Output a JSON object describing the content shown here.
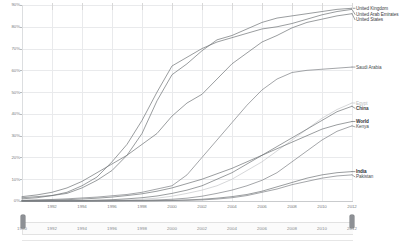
{
  "chart_data": {
    "type": "line",
    "title": "",
    "xlabel": "",
    "ylabel": "",
    "xlim": [
      1990,
      2012
    ],
    "ylim": [
      0,
      90
    ],
    "grid": true,
    "legend_position": "right-of-plot-at-line-end",
    "ytick_labels": [
      "90%",
      "80%",
      "70%",
      "60%",
      "50%",
      "40%",
      "30%",
      "20%",
      "10%",
      "0%"
    ],
    "ytick_values": [
      90,
      80,
      70,
      60,
      50,
      40,
      30,
      20,
      10,
      0
    ],
    "xtick_labels": [
      "1992",
      "1994",
      "1996",
      "1998",
      "2000",
      "2002",
      "2004",
      "2006",
      "2008",
      "2010",
      "2012"
    ],
    "xtick_values": [
      1992,
      1994,
      1996,
      1998,
      2000,
      2002,
      2004,
      2006,
      2008,
      2010,
      2012
    ],
    "x": [
      1990,
      1991,
      1992,
      1993,
      1994,
      1995,
      1996,
      1997,
      1998,
      1999,
      2000,
      2001,
      2002,
      2003,
      2004,
      2005,
      2006,
      2007,
      2008,
      2009,
      2010,
      2011,
      2012
    ],
    "series": [
      {
        "name": "United Kingdom",
        "color": "#6e7276",
        "label_color": "#3a3d40",
        "label_bold": false,
        "values": [
          1.5,
          2.0,
          2.5,
          3.5,
          6.0,
          9.5,
          14.0,
          21.0,
          31.0,
          46.0,
          58.0,
          63.0,
          69.0,
          74.0,
          76.0,
          79.0,
          82.0,
          84.0,
          85.0,
          86.0,
          87.0,
          88.0,
          88.5
        ]
      },
      {
        "name": "United Arab Emirates",
        "color": "#6e7276",
        "label_color": "#3a3d40",
        "label_bold": false,
        "values": [
          1.0,
          1.5,
          2.5,
          4.0,
          7.0,
          11.0,
          18.0,
          26.0,
          37.0,
          50.0,
          62.0,
          66.0,
          70.0,
          73.0,
          75.0,
          77.0,
          79.0,
          80.0,
          81.5,
          83.5,
          85.5,
          87.0,
          88.0
        ]
      },
      {
        "name": "United States",
        "color": "#6e7276",
        "label_color": "#3a3d40",
        "label_bold": false,
        "values": [
          2.0,
          2.8,
          4.0,
          6.0,
          9.0,
          13.0,
          17.0,
          21.0,
          26.0,
          31.0,
          39.0,
          45.0,
          49.0,
          56.0,
          63.0,
          68.0,
          73.0,
          76.0,
          79.5,
          82.0,
          83.5,
          85.0,
          86.0
        ]
      },
      {
        "name": "Saudi Arabia",
        "color": "#7c8084",
        "label_color": "#4a4d50",
        "label_bold": false,
        "values": [
          0.3,
          0.5,
          0.7,
          1.0,
          1.4,
          1.8,
          2.4,
          3.0,
          4.0,
          5.5,
          7.0,
          12.0,
          20.0,
          28.0,
          36.0,
          44.0,
          51.0,
          56.0,
          59.0,
          60.0,
          60.5,
          61.0,
          61.5
        ]
      },
      {
        "name": "Egypt",
        "color": "#c4c6c8",
        "label_color": "#b8babc",
        "label_bold": false,
        "values": [
          0.0,
          0.0,
          0.1,
          0.1,
          0.2,
          0.2,
          0.3,
          0.5,
          0.8,
          1.3,
          2.2,
          3.5,
          5.0,
          7.0,
          10.0,
          14.0,
          18.0,
          23.0,
          28.0,
          33.0,
          38.0,
          42.0,
          45.0
        ]
      },
      {
        "name": "China",
        "color": "#6e7276",
        "label_color": "#3a3d40",
        "label_bold": true,
        "values": [
          0.0,
          0.0,
          0.1,
          0.1,
          0.2,
          0.4,
          0.6,
          1.0,
          1.5,
          2.3,
          3.5,
          5.0,
          7.0,
          10.0,
          13.0,
          17.0,
          21.0,
          25.0,
          29.0,
          33.0,
          37.0,
          41.0,
          43.5
        ]
      },
      {
        "name": "World",
        "color": "#6e7276",
        "label_color": "#26292c",
        "label_bold": true,
        "values": [
          0.2,
          0.3,
          0.4,
          0.6,
          0.9,
          1.3,
          1.8,
          2.5,
          3.3,
          4.5,
          6.0,
          8.0,
          10.0,
          12.5,
          15.0,
          18.0,
          21.0,
          24.0,
          27.0,
          30.0,
          33.0,
          35.0,
          36.5
        ]
      },
      {
        "name": "Kenya",
        "color": "#7c8084",
        "label_color": "#4a4d50",
        "label_bold": false,
        "values": [
          0.0,
          0.0,
          0.0,
          0.0,
          0.0,
          0.1,
          0.1,
          0.2,
          0.3,
          0.5,
          0.8,
          1.3,
          2.2,
          3.5,
          5.0,
          7.0,
          9.5,
          13.0,
          18.0,
          23.0,
          28.0,
          32.0,
          34.5
        ]
      },
      {
        "name": "India",
        "color": "#6e7276",
        "label_color": "#26292c",
        "label_bold": true,
        "values": [
          0.0,
          0.0,
          0.0,
          0.0,
          0.0,
          0.0,
          0.1,
          0.1,
          0.1,
          0.2,
          0.3,
          0.5,
          0.8,
          1.3,
          2.0,
          3.0,
          4.5,
          6.5,
          8.5,
          10.5,
          12.0,
          13.0,
          13.5
        ]
      },
      {
        "name": "Pakistan",
        "color": "#7c8084",
        "label_color": "#4a4d50",
        "label_bold": false,
        "values": [
          0.0,
          0.0,
          0.0,
          0.0,
          0.0,
          0.0,
          0.0,
          0.1,
          0.1,
          0.1,
          0.2,
          0.3,
          0.5,
          0.9,
          1.5,
          2.5,
          4.0,
          5.5,
          7.5,
          9.0,
          10.5,
          11.5,
          12.0
        ]
      }
    ]
  },
  "range_slider": {
    "start_label": "1990",
    "end_label": "2012",
    "tick_labels": [
      "1990",
      "1992",
      "1994",
      "1996",
      "1998",
      "2000",
      "2002",
      "2004",
      "2006",
      "2008",
      "2010",
      "2012"
    ],
    "tick_values": [
      1990,
      1992,
      1994,
      1996,
      1998,
      2000,
      2002,
      2004,
      2006,
      2008,
      2010,
      2012
    ],
    "selected_from": 1990,
    "selected_to": 2012
  },
  "colors": {
    "gridline": "#e9eaec",
    "axis": "#c9cbcd",
    "line_default": "#6e7276",
    "line_muted": "#c4c6c8",
    "tick_text": "#7a7d80",
    "slider_handle": "#8d9095",
    "slider_track": "#f4f4f4"
  }
}
